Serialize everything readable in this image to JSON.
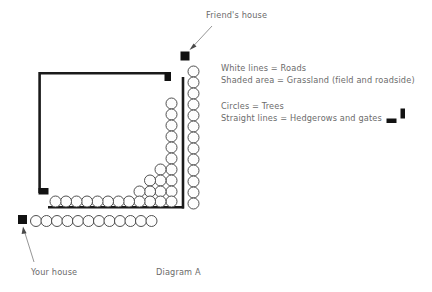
{
  "figure": {
    "caption": "Diagram A",
    "background": "#ffffff",
    "ink": "#1a1a1a",
    "text_color": "#6b6b6b"
  },
  "labels": {
    "friends_house": "Friend's house",
    "your_house": "Your house"
  },
  "legend": {
    "lines": [
      "White lines = Roads",
      "Shaded area = Grassland (field and roadside)"
    ],
    "lines2": [
      "Circles = Trees",
      "Straight lines = Hedgerows and gates"
    ]
  },
  "map": {
    "houses": [
      {
        "name": "friends-house",
        "x": 180,
        "y": 52,
        "size": 9
      },
      {
        "name": "your-house",
        "x": 18,
        "y": 215,
        "size": 9
      }
    ],
    "hedgerows": [
      {
        "name": "hedgerow-top",
        "x1": 39,
        "y1": 73,
        "x2": 171,
        "y2": 73
      },
      {
        "name": "hedgerow-left",
        "x1": 39,
        "y1": 73,
        "x2": 39,
        "y2": 196
      },
      {
        "name": "hedgerow-gate-top-right",
        "x1": 164,
        "y1": 73,
        "x2": 170,
        "y2": 82
      },
      {
        "name": "hedgerow-gate-bottom-left",
        "x1": 39,
        "y1": 190,
        "x2": 48,
        "y2": 196
      },
      {
        "name": "hedgerow-right",
        "x1": 183,
        "y1": 78,
        "x2": 183,
        "y2": 207
      },
      {
        "name": "hedgerow-bottom",
        "x1": 49,
        "y1": 207,
        "x2": 183,
        "y2": 207
      }
    ],
    "tree_radius": 5.4,
    "tree_rows": {
      "outer_right_column_count": 12,
      "inner_right_column_count": 9,
      "inner_bottom_row_count": 13,
      "outer_bottom_row_count": 12,
      "corner_cluster_count": 5
    }
  },
  "icons": {
    "gate_horizontal": "gate-bar-horizontal",
    "gate_vertical": "gate-bar-vertical",
    "arrow": "arrow-pointer"
  }
}
